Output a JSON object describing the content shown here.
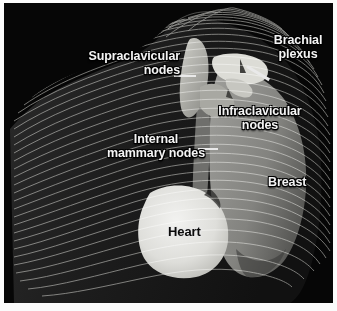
{
  "figure": {
    "name": "chest-lymph-node-anatomy-illustration",
    "style": "contour-line 3D rendering, white lines on black background",
    "background_color": "#060606",
    "page_margin_color": "#fbfbfb"
  },
  "labels": {
    "supraclavicular": {
      "text": "Supraclavicular\nnodes",
      "color": "#f4f4f4"
    },
    "brachial_plexus": {
      "text": "Brachial\nplexus",
      "color": "#f4f4f4"
    },
    "infraclavicular": {
      "text": "Infraclavicular\nnodes",
      "color": "#f4f4f4"
    },
    "internal_mammary": {
      "text": "Internal\nmammary nodes",
      "color": "#f4f4f4"
    },
    "breast": {
      "text": "Breast",
      "color": "#f4f4f4"
    },
    "heart": {
      "text": "Heart",
      "color": "#0b0b0b"
    }
  },
  "structures": {
    "torso": {
      "name": "torso",
      "fill": "#1a1a1a"
    },
    "breast_mound": {
      "name": "breast",
      "fill": "#8d8d8d"
    },
    "heart": {
      "name": "heart",
      "fill": "#e3e3e1"
    },
    "node_chain_upper": {
      "name": "supraclavicular-infraclavicular-node-chain",
      "fill": "#b9b9b4"
    },
    "brachial_plexus": {
      "name": "brachial-plexus",
      "fill": "#d8d8d2"
    },
    "internal_mammary_chain": {
      "name": "internal-mammary-node-chain",
      "fill": "#9a9a96"
    }
  }
}
